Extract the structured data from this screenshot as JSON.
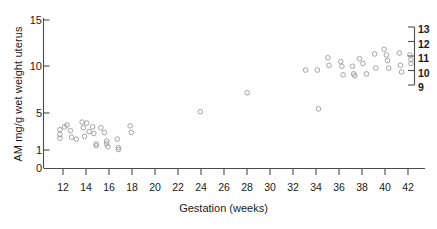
{
  "chart_data": {
    "type": "scatter",
    "title": "",
    "xlabel": "Gestation (weeks)",
    "ylabel": "AM mg/g wet weight uterus",
    "xlim": [
      10.6,
      43.2
    ],
    "ylim": [
      0,
      15.9
    ],
    "xticks": [
      12,
      14,
      16,
      18,
      20,
      22,
      24,
      26,
      28,
      30,
      32,
      34,
      36,
      38,
      40,
      42
    ],
    "xticklabels": [
      "12",
      "14",
      "16",
      "18",
      "20",
      "22",
      "24",
      "26",
      "28",
      "30",
      "32",
      "34",
      "36",
      "38",
      "40",
      "42"
    ],
    "yticks": [
      0,
      1,
      5,
      10,
      15
    ],
    "yticklabels": [
      "0",
      "1",
      "5",
      "10",
      "15"
    ],
    "grid": false,
    "legend": null,
    "marker": "open-circle",
    "marker_color": "#9a9a9a",
    "secondary_axis": {
      "position": "right",
      "ticks": [
        9,
        10,
        11,
        12,
        13
      ],
      "ticklabels": [
        "9",
        "10",
        "11",
        "12",
        "13"
      ],
      "label": ""
    },
    "points": [
      {
        "x": 12.0,
        "y": 4.1
      },
      {
        "x": 12.0,
        "y": 3.6
      },
      {
        "x": 12.0,
        "y": 3.2
      },
      {
        "x": 12.4,
        "y": 4.4
      },
      {
        "x": 12.6,
        "y": 4.6
      },
      {
        "x": 12.9,
        "y": 4.0
      },
      {
        "x": 13.0,
        "y": 3.3
      },
      {
        "x": 13.4,
        "y": 3.1
      },
      {
        "x": 13.9,
        "y": 4.9
      },
      {
        "x": 14.0,
        "y": 4.3
      },
      {
        "x": 14.1,
        "y": 3.4
      },
      {
        "x": 14.3,
        "y": 4.8
      },
      {
        "x": 14.5,
        "y": 3.9
      },
      {
        "x": 14.8,
        "y": 4.4
      },
      {
        "x": 14.9,
        "y": 3.7
      },
      {
        "x": 15.1,
        "y": 2.6
      },
      {
        "x": 15.1,
        "y": 2.4
      },
      {
        "x": 15.5,
        "y": 4.3
      },
      {
        "x": 15.8,
        "y": 3.8
      },
      {
        "x": 16.0,
        "y": 2.9
      },
      {
        "x": 16.0,
        "y": 2.6
      },
      {
        "x": 16.1,
        "y": 2.3
      },
      {
        "x": 16.9,
        "y": 3.1
      },
      {
        "x": 17.0,
        "y": 2.2
      },
      {
        "x": 17.0,
        "y": 2.0
      },
      {
        "x": 18.0,
        "y": 4.5
      },
      {
        "x": 18.1,
        "y": 3.8
      },
      {
        "x": 24.0,
        "y": 6.0
      },
      {
        "x": 28.0,
        "y": 8.0
      },
      {
        "x": 33.0,
        "y": 10.4
      },
      {
        "x": 34.0,
        "y": 10.4
      },
      {
        "x": 34.1,
        "y": 6.3
      },
      {
        "x": 34.9,
        "y": 11.7
      },
      {
        "x": 35.0,
        "y": 10.9
      },
      {
        "x": 36.0,
        "y": 11.3
      },
      {
        "x": 36.1,
        "y": 10.8
      },
      {
        "x": 36.2,
        "y": 9.9
      },
      {
        "x": 37.0,
        "y": 10.8
      },
      {
        "x": 37.1,
        "y": 10.0
      },
      {
        "x": 37.2,
        "y": 9.8
      },
      {
        "x": 37.6,
        "y": 11.6
      },
      {
        "x": 37.9,
        "y": 11.1
      },
      {
        "x": 38.2,
        "y": 10.0
      },
      {
        "x": 38.9,
        "y": 12.1
      },
      {
        "x": 39.0,
        "y": 10.6
      },
      {
        "x": 39.7,
        "y": 12.6
      },
      {
        "x": 39.9,
        "y": 12.0
      },
      {
        "x": 40.0,
        "y": 11.4
      },
      {
        "x": 40.1,
        "y": 10.6
      },
      {
        "x": 41.0,
        "y": 12.2
      },
      {
        "x": 41.1,
        "y": 10.9
      },
      {
        "x": 41.2,
        "y": 10.2
      },
      {
        "x": 41.9,
        "y": 12.0
      },
      {
        "x": 42.0,
        "y": 11.5
      },
      {
        "x": 42.0,
        "y": 11.1
      }
    ]
  },
  "axis": {
    "ylabel_text": "AM mg/g wet weight uterus",
    "xlabel_text": "Gestation (weeks)",
    "ytick_0": "0",
    "ytick_1": "1",
    "ytick_5": "5",
    "ytick_10": "10",
    "ytick_15": "15",
    "xtick_12": "12",
    "xtick_14": "14",
    "xtick_16": "16",
    "xtick_18": "18",
    "xtick_20": "20",
    "xtick_22": "22",
    "xtick_24": "24",
    "xtick_26": "26",
    "xtick_28": "28",
    "xtick_30": "30",
    "xtick_32": "32",
    "xtick_34": "34",
    "xtick_36": "36",
    "xtick_38": "38",
    "xtick_40": "40",
    "xtick_42": "42",
    "rtick_9": "9",
    "rtick_10": "10",
    "rtick_11": "11",
    "rtick_12": "12",
    "rtick_13": "13"
  }
}
